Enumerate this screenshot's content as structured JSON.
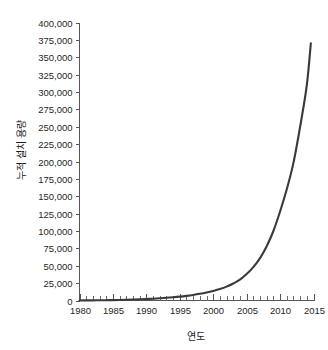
{
  "chart_data": {
    "type": "line",
    "title": "",
    "subtitle": "",
    "xlabel": "연도",
    "ylabel": "누적 설치 용량",
    "xlim": [
      1980,
      2015
    ],
    "ylim": [
      0,
      400000
    ],
    "grid": false,
    "legend": null,
    "legend_position": "none",
    "x_major_step": 5,
    "x_minor_step": 1,
    "y_major_step": 25000,
    "x_tick_labels": [
      "1980",
      "1985",
      "1990",
      "1995",
      "2000",
      "2005",
      "2010",
      "2015"
    ],
    "x_tick_values": [
      1980,
      1985,
      1990,
      1995,
      2000,
      2005,
      2010,
      2015
    ],
    "y_tick_labels": [
      "0",
      "25,000",
      "50,000",
      "75,000",
      "100,000",
      "125,000",
      "150,000",
      "175,000",
      "200,000",
      "225,000",
      "250,000",
      "275,000",
      "300,000",
      "325,000",
      "350,000",
      "375,000",
      "400,000"
    ],
    "y_tick_values": [
      0,
      25000,
      50000,
      75000,
      100000,
      125000,
      150000,
      175000,
      200000,
      225000,
      250000,
      275000,
      300000,
      325000,
      350000,
      375000,
      400000
    ],
    "series": [
      {
        "name": "누적 설치 용량",
        "color": "#3a3a3a",
        "x": [
          1980,
          1981,
          1982,
          1983,
          1984,
          1985,
          1986,
          1987,
          1988,
          1989,
          1990,
          1991,
          1992,
          1993,
          1994,
          1995,
          1996,
          1997,
          1998,
          1999,
          2000,
          2001,
          2002,
          2003,
          2004,
          2005,
          2006,
          2007,
          2008,
          2009,
          2010,
          2011,
          2012,
          2013,
          2014
        ],
        "values": [
          100,
          150,
          220,
          320,
          450,
          600,
          800,
          1050,
          1350,
          1700,
          2100,
          2600,
          3200,
          3900,
          4700,
          5600,
          6700,
          8000,
          9600,
          11500,
          13800,
          16500,
          20000,
          24500,
          30000,
          38000,
          48000,
          61000,
          78000,
          100000,
          128000,
          160000,
          198000,
          250000,
          310000
        ],
        "end_value": 370000
      }
    ],
    "annotations": []
  },
  "accent_colors": {
    "curve": "#3a3a3a",
    "axis": "#555555",
    "text": "#1a1a1a",
    "background": "#ffffff"
  }
}
